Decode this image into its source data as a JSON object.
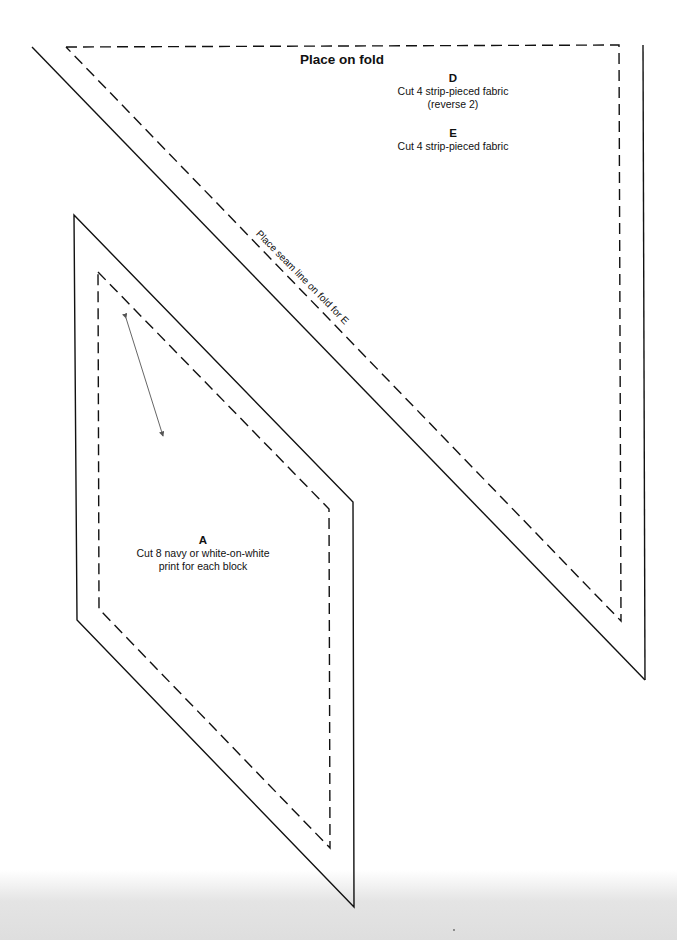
{
  "pattern": {
    "fold_label": "Place on fold",
    "seam_note": "Place seam line on fold for E",
    "pieces": {
      "d": {
        "letter": "D",
        "line1": "Cut 4 strip-pieced fabric",
        "line2": "(reverse 2)"
      },
      "e": {
        "letter": "E",
        "line1": "Cut 4 strip-pieced fabric"
      },
      "a": {
        "letter": "A",
        "line1": "Cut 8 navy or white-on-white",
        "line2": "print for each block"
      }
    },
    "line_color": "#111111",
    "grain_arrow_color": "#555555"
  }
}
